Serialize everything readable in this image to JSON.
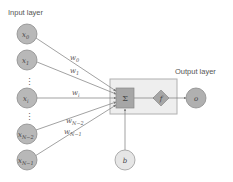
{
  "diagram": {
    "title_input": "Input layer",
    "title_output": "Output layer",
    "inputs": [
      {
        "base": "x",
        "sub": "0",
        "cy": 34
      },
      {
        "base": "x",
        "sub": "1",
        "cy": 60
      },
      {
        "base": "x",
        "sub": "i",
        "cy": 98
      },
      {
        "base": "x",
        "sub": "N−2",
        "cy": 134
      },
      {
        "base": "x",
        "sub": "N−1",
        "cy": 160
      }
    ],
    "ellipsis_marks": [
      "⋮",
      "⋮"
    ],
    "weights": [
      {
        "base": "w",
        "sub": "0"
      },
      {
        "base": "w",
        "sub": "1"
      },
      {
        "base": "w",
        "sub": "i"
      },
      {
        "base": "w",
        "sub": "N−2"
      },
      {
        "base": "w",
        "sub": "N−1"
      }
    ],
    "summation_symbol": "Σ",
    "activation_symbol": "f",
    "output_symbol": "o",
    "bias_symbol": "b",
    "colors": {
      "node_fill": "#b8b8b8",
      "node_stroke": "#8c8c8c",
      "box_fill": "#eeeeee",
      "box_stroke": "#b0b0b0",
      "sum_fill": "#a6a6a6",
      "line": "#7a7a7a",
      "bias_fill": "#e6e6e6"
    }
  }
}
